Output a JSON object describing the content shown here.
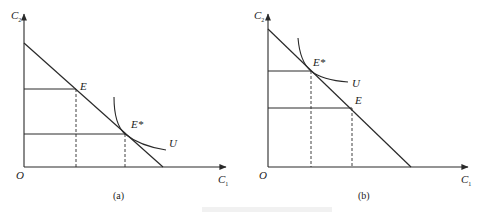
{
  "panels": [
    {
      "id": "a",
      "caption": "(a)",
      "y_axis_label": "C",
      "y_axis_sub": "2",
      "x_axis_label": "C",
      "x_axis_sub": "1",
      "origin_label": "O",
      "points": {
        "E": {
          "label": "E"
        },
        "E_star": {
          "label": "E*"
        }
      },
      "curve_label": "U",
      "description": "Optimal point E* lies below and right of endowment E on the budget line"
    },
    {
      "id": "b",
      "caption": "(b)",
      "y_axis_label": "C",
      "y_axis_sub": "2",
      "x_axis_label": "C",
      "x_axis_sub": "1",
      "origin_label": "O",
      "points": {
        "E": {
          "label": "E"
        },
        "E_star": {
          "label": "E*"
        }
      },
      "curve_label": "U",
      "description": "Optimal point E* lies above and left of endowment E on the budget line"
    }
  ],
  "figure_caption": ""
}
